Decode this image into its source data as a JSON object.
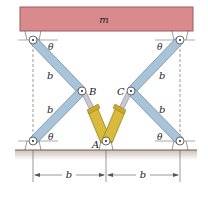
{
  "figure": {
    "mass_label": "m",
    "angle_label": "θ",
    "length_label": "b",
    "points": {
      "A": "A",
      "B": "B",
      "C": "C"
    },
    "dimensions": [
      "b",
      "b"
    ]
  },
  "colors": {
    "mass_fill": "#d98a8c",
    "mass_stroke": "#9a5a5c",
    "link_fill": "#a9c3d9",
    "link_stroke": "#6f8ea8",
    "cylinder_fill": "#d8bb3c",
    "cylinder_stroke": "#9a8220",
    "rod_fill": "#c9c9d6",
    "ground_fill": "#d9cfc8",
    "ground_line": "#6d5f55"
  }
}
